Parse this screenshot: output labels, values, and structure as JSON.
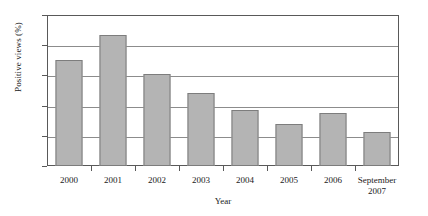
{
  "chart_data": {
    "type": "bar",
    "title": "",
    "xlabel": "Year",
    "ylabel": "Positive views (%)",
    "categories": [
      "2000",
      "2001",
      "2002",
      "2003",
      "2004",
      "2005",
      "2006",
      "September 2007"
    ],
    "category_lines": [
      [
        "2000"
      ],
      [
        "2001"
      ],
      [
        "2002"
      ],
      [
        "2003"
      ],
      [
        "2004"
      ],
      [
        "2005"
      ],
      [
        "2006"
      ],
      [
        "September",
        "2007"
      ]
    ],
    "values": [
      70.5,
      86.5,
      61,
      48.5,
      37,
      27.5,
      35,
      22.5
    ],
    "ylim": [
      0,
      100
    ],
    "yticks": [
      0,
      20,
      40,
      60,
      80,
      100
    ],
    "ytick_labels": [
      "0",
      "20",
      "40",
      "60",
      "80",
      "100"
    ],
    "grid": "horizontal",
    "legend": "none",
    "bar_color": "#b4b4b4",
    "bar_border_color": "#7d7d7d",
    "axis_color": "#595959",
    "grid_color": "#8c8c8c"
  }
}
